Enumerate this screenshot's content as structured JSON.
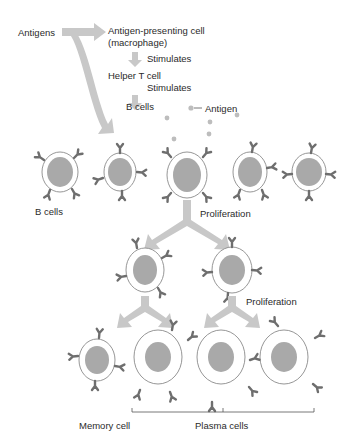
{
  "diagram": {
    "labels": {
      "antigens": "Antigens",
      "apc_line1": "Antigen-presenting cell",
      "apc_line2": "(macrophage)",
      "stimulates_1": "Stimulates",
      "helper_t": "Helper T cell",
      "stimulates_2": "Stimulates",
      "b_cells_top": "B cells",
      "antigen": "Antigen",
      "b_cells_row": "B cells",
      "proliferation_1": "Proliferation",
      "proliferation_2": "Proliferation",
      "memory_cell": "Memory cell",
      "plasma_cells": "Plasma cells"
    },
    "colors": {
      "arrow": "#c8c8c8",
      "nucleus": "#a9a9a9",
      "cell_outline": "#8a8a8a",
      "antibody": "#6e6e6e",
      "antigen_dot": "#bdbdbd",
      "text": "#2a2a2a"
    }
  }
}
